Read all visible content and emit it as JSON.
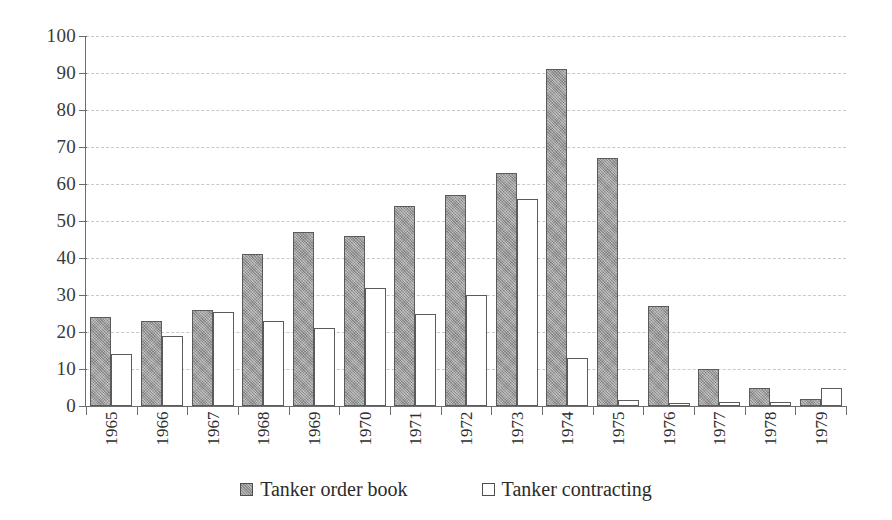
{
  "chart_data": {
    "type": "bar",
    "title": "",
    "xlabel": "",
    "ylabel": "",
    "ylim": [
      0,
      100
    ],
    "ytick_step": 10,
    "yticks": [
      0,
      10,
      20,
      30,
      40,
      50,
      60,
      70,
      80,
      90,
      100
    ],
    "grid": true,
    "grid_axis": "y",
    "grid_style": "dashed",
    "legend_position": "bottom-center",
    "categories": [
      "1965",
      "1966",
      "1967",
      "1968",
      "1969",
      "1970",
      "1971",
      "1972",
      "1973",
      "1974",
      "1975",
      "1976",
      "1977",
      "1978",
      "1979"
    ],
    "series": [
      {
        "name": "Tanker order book",
        "color": "#9e9e9e",
        "values": [
          24,
          23,
          26,
          41,
          47,
          46,
          54,
          57,
          63,
          91,
          67,
          27,
          10,
          5,
          2
        ]
      },
      {
        "name": "Tanker contracting",
        "color": "#ffffff",
        "values": [
          14,
          19,
          25.5,
          23,
          21,
          32,
          25,
          30,
          56,
          13,
          1.5,
          0.7,
          1.2,
          1,
          5
        ]
      }
    ]
  },
  "axis": {
    "y_tick_labels": [
      "100",
      "90",
      "80",
      "70",
      "60",
      "50",
      "40",
      "30",
      "20",
      "10",
      "0"
    ],
    "x_tick_labels": [
      "1965",
      "1966",
      "1967",
      "1968",
      "1969",
      "1970",
      "1971",
      "1972",
      "1973",
      "1974",
      "1975",
      "1976",
      "1977",
      "1978",
      "1979"
    ]
  },
  "legend": {
    "items": [
      {
        "label": "Tanker order book",
        "swatch": "filled-gray-square"
      },
      {
        "label": "Tanker contracting",
        "swatch": "outlined-white-square"
      }
    ]
  },
  "colors": {
    "series_order_book": "#9e9e9e",
    "series_contracting": "#ffffff",
    "bar_outline": "#5b5b5b",
    "gridline": "#c9c9c9",
    "axis_line": "#6d6d6d",
    "text": "#2b2b2b",
    "background": "#ffffff"
  }
}
